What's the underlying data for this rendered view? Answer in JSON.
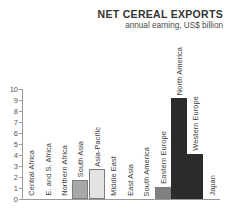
{
  "chart_data": {
    "type": "bar",
    "title": "NET CEREAL EXPORTS",
    "subtitle": "annual earning, US$ billion",
    "xlabel": "",
    "ylabel": "",
    "ylim": [
      0,
      10
    ],
    "yticks": [
      "0",
      "1",
      "2",
      "3",
      "4",
      "5",
      "6",
      "7",
      "8",
      "9",
      "10"
    ],
    "grid": false,
    "legend": "none",
    "categories": [
      "Central Africa",
      "E. and S. Africa",
      "Northern Africa",
      "South Asia",
      "Asia-Pacific",
      "Middle East",
      "East Asia",
      "South America",
      "Eastern Europe",
      "North America",
      "Western Europe",
      "Japan"
    ],
    "values": [
      0,
      0,
      0,
      1.7,
      2.7,
      0,
      0,
      0,
      1.1,
      9.2,
      4.1,
      0
    ],
    "bar_colors": [
      "none",
      "none",
      "none",
      "#a8a8a8",
      "#e2e2e2",
      "none",
      "none",
      "none",
      "#808080",
      "#2b2b2b",
      "#2b2b2b",
      "none"
    ]
  },
  "axis": {
    "line_color": "#9a9a9a",
    "tick_color": "#9a9a9a",
    "label_color": "#555555"
  }
}
